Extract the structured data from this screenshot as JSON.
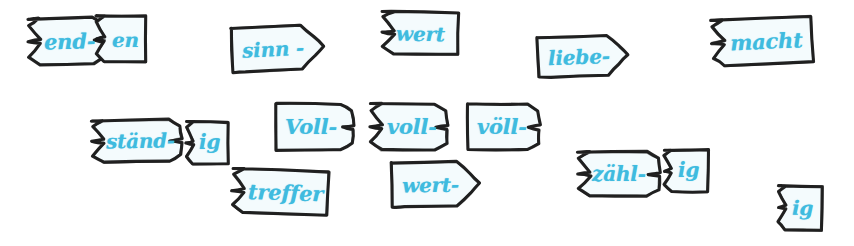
{
  "canvas": {
    "width": 854,
    "height": 246,
    "background": "#ffffff",
    "description": "Hand-drawn German word-building puzzle cards with jigsaw-style notched edges"
  },
  "style": {
    "ink_color": "#1a1a1a",
    "text_color": "#3fbbdf",
    "card_fill": "#f4fbfd"
  },
  "cards": [
    {
      "id": "end",
      "label": "end-",
      "shape": "left-notch-right-tab",
      "row": "top",
      "x": 28,
      "y": 18,
      "width": 78,
      "height": 46,
      "rotation": -1.5,
      "font_size": 21,
      "label_x": 16,
      "label_y": 13
    },
    {
      "id": "en",
      "label": "en",
      "shape": "left-notch-plain-right",
      "row": "top",
      "x": 96,
      "y": 16,
      "width": 50,
      "height": 46,
      "rotation": 0.5,
      "font_size": 20,
      "label_x": 16,
      "label_y": 14
    },
    {
      "id": "sinn",
      "label": "sinn -",
      "shape": "arrow-right",
      "row": "top",
      "x": 232,
      "y": 26,
      "width": 92,
      "height": 44,
      "rotation": -3,
      "font_size": 20,
      "label_x": 10,
      "label_y": 13
    },
    {
      "id": "wert-top",
      "label": "wert",
      "shape": "left-notch-plain-right",
      "row": "top",
      "x": 382,
      "y": 12,
      "width": 76,
      "height": 42,
      "rotation": 1,
      "font_size": 20,
      "label_x": 14,
      "label_y": 12
    },
    {
      "id": "liebe",
      "label": "liebe-",
      "shape": "arrow-right",
      "row": "top",
      "x": 538,
      "y": 36,
      "width": 90,
      "height": 40,
      "rotation": -2,
      "font_size": 20,
      "label_x": 10,
      "label_y": 11
    },
    {
      "id": "macht",
      "label": "macht",
      "shape": "left-notch-plain-right",
      "row": "top",
      "x": 712,
      "y": 18,
      "width": 100,
      "height": 46,
      "rotation": -2.5,
      "font_size": 21,
      "label_x": 18,
      "label_y": 13
    },
    {
      "id": "staend",
      "label": "ständ-",
      "shape": "left-notch-right-tab",
      "row": "middle",
      "x": 92,
      "y": 120,
      "width": 90,
      "height": 42,
      "rotation": -1,
      "font_size": 20,
      "label_x": 14,
      "label_y": 11
    },
    {
      "id": "ig-left",
      "label": "ig",
      "shape": "left-notch-plain-right",
      "row": "middle",
      "x": 186,
      "y": 122,
      "width": 42,
      "height": 42,
      "rotation": 0,
      "font_size": 20,
      "label_x": 13,
      "label_y": 10
    },
    {
      "id": "Voll",
      "label": "Voll-",
      "shape": "plain-left-right-tab",
      "row": "middle",
      "x": 276,
      "y": 104,
      "width": 78,
      "height": 46,
      "rotation": 0,
      "font_size": 21,
      "label_x": 9,
      "label_y": 12
    },
    {
      "id": "voll",
      "label": "voll-",
      "shape": "left-notch-right-tab",
      "row": "middle",
      "x": 370,
      "y": 104,
      "width": 78,
      "height": 46,
      "rotation": 0,
      "font_size": 21,
      "label_x": 17,
      "label_y": 12
    },
    {
      "id": "voell",
      "label": "völl-",
      "shape": "plain-left-right-tab",
      "row": "middle",
      "x": 468,
      "y": 104,
      "width": 72,
      "height": 46,
      "rotation": 0,
      "font_size": 21,
      "label_x": 9,
      "label_y": 12
    },
    {
      "id": "treffer",
      "label": "treffer",
      "shape": "left-notch-plain-right",
      "row": "bottom",
      "x": 232,
      "y": 170,
      "width": 96,
      "height": 44,
      "rotation": 2,
      "font_size": 21,
      "label_x": 16,
      "label_y": 12
    },
    {
      "id": "wert-bottom",
      "label": "wert-",
      "shape": "arrow-right",
      "row": "bottom",
      "x": 392,
      "y": 162,
      "width": 88,
      "height": 44,
      "rotation": -1,
      "font_size": 20,
      "label_x": 10,
      "label_y": 13
    },
    {
      "id": "zaehl",
      "label": "zähl-",
      "shape": "left-notch-right-tab",
      "row": "bottom",
      "x": 578,
      "y": 152,
      "width": 82,
      "height": 44,
      "rotation": 0,
      "font_size": 20,
      "label_x": 14,
      "label_y": 12
    },
    {
      "id": "ig-mid",
      "label": "ig",
      "shape": "left-notch-plain-right",
      "row": "bottom",
      "x": 664,
      "y": 150,
      "width": 44,
      "height": 42,
      "rotation": 0,
      "font_size": 20,
      "label_x": 14,
      "label_y": 10
    },
    {
      "id": "ig-right",
      "label": "ig",
      "shape": "left-notch-plain-right",
      "row": "bottom",
      "x": 778,
      "y": 186,
      "width": 44,
      "height": 44,
      "rotation": 1,
      "font_size": 20,
      "label_x": 14,
      "label_y": 12
    }
  ]
}
